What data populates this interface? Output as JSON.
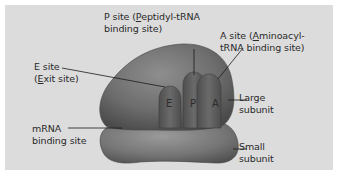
{
  "diagram": {
    "labels": {
      "p_site": {
        "line1_pre": "P site (",
        "line1_ul": "P",
        "line1_post": "eptidyl-tRNA",
        "line2": "binding site)"
      },
      "a_site": {
        "line1_pre": "A site (",
        "line1_ul": "A",
        "line1_post": "minoacyl-",
        "line2": "tRNA binding site)"
      },
      "e_site": {
        "line1": "E site",
        "line2_pre": "(",
        "line2_ul": "E",
        "line2_post": "xit site)"
      },
      "large_subunit": {
        "line1": "Large",
        "line2": "subunit"
      },
      "small_subunit": {
        "line1": "Small",
        "line2": "subunit"
      },
      "mrna_site": {
        "line1": "mRNA",
        "line2": "binding site"
      }
    },
    "site_letters": {
      "e": "E",
      "p": "P",
      "a": "A"
    },
    "colors": {
      "panel": "#dcdcdc",
      "large_subunit": "#6f6f6f",
      "small_subunit": "#7a7a7a",
      "tunnel": "#5c5c5c",
      "leader_line": "#1a1a1a"
    }
  }
}
